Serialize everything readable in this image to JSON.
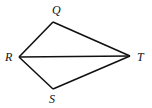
{
  "diagram": {
    "type": "geometry-figure",
    "stroke_color": "#111111",
    "vertices": [
      {
        "id": "Q",
        "label": "Q",
        "x": 53,
        "y": 22,
        "label_x": 52,
        "label_y": 14
      },
      {
        "id": "R",
        "label": "R",
        "x": 19,
        "y": 57,
        "label_x": 5,
        "label_y": 61
      },
      {
        "id": "T",
        "label": "T",
        "x": 130,
        "y": 56,
        "label_x": 137,
        "label_y": 61
      },
      {
        "id": "S",
        "label": "S",
        "x": 53,
        "y": 89,
        "label_x": 49,
        "label_y": 103
      }
    ],
    "segments": [
      {
        "from": "R",
        "to": "Q"
      },
      {
        "from": "Q",
        "to": "T"
      },
      {
        "from": "T",
        "to": "S"
      },
      {
        "from": "S",
        "to": "R"
      },
      {
        "from": "R",
        "to": "T"
      }
    ]
  }
}
